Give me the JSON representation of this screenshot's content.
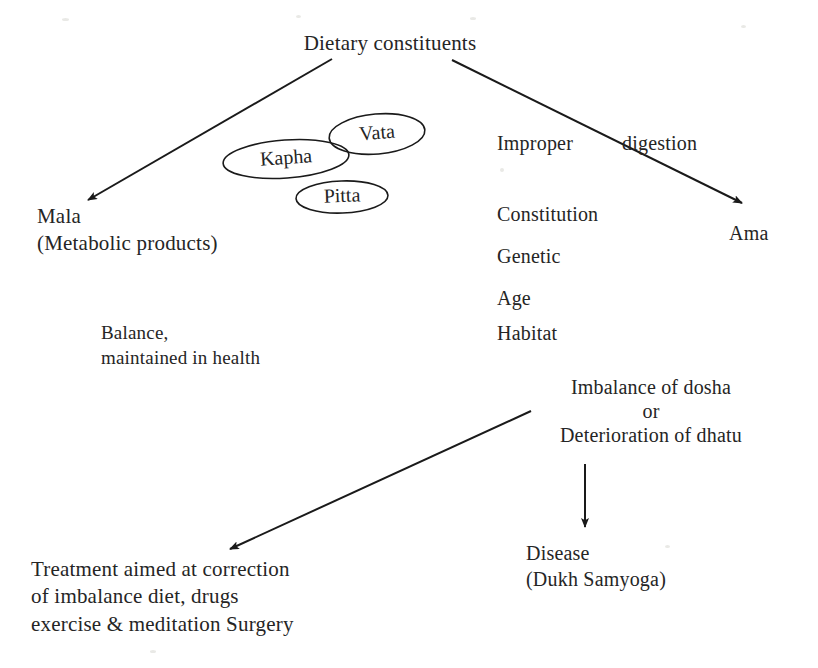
{
  "diagram": {
    "title_node": "Dietary constituents",
    "nodes": {
      "mala": "Mala\n(Metabolic products)",
      "improper_digestion_left": "Improper",
      "improper_digestion_right": "digestion",
      "ama": "Ama",
      "factors": [
        "Constitution",
        "Genetic",
        "Age",
        "Habitat"
      ],
      "balance": "Balance,\nmaintained in health",
      "imbalance_line1": "Imbalance of dosha",
      "imbalance_line2": "or",
      "imbalance_line3": "Deterioration of dhatu",
      "disease": "Disease\n(Dukh Samyoga)",
      "treatment": "Treatment aimed at correction\nof imbalance diet, drugs\nexercise & meditation Surgery"
    },
    "doshas": [
      {
        "label": "Vata",
        "cx": 377,
        "cy": 134,
        "rx": 48,
        "ry": 20,
        "rotate": -5
      },
      {
        "label": "Kapha",
        "cx": 286,
        "cy": 159,
        "rx": 63,
        "ry": 19,
        "rotate": -4
      },
      {
        "label": "Pitta",
        "cx": 342,
        "cy": 197,
        "rx": 46,
        "ry": 16,
        "rotate": -2
      }
    ],
    "arrows": [
      {
        "name": "to-mala",
        "x1": 332,
        "y1": 59,
        "x2": 88,
        "y2": 200
      },
      {
        "name": "to-ama",
        "x1": 452,
        "y1": 60,
        "x2": 742,
        "y2": 203
      },
      {
        "name": "to-treatment",
        "x1": 531,
        "y1": 411,
        "x2": 230,
        "y2": 549
      },
      {
        "name": "to-disease",
        "x1": 585,
        "y1": 464,
        "x2": 585,
        "y2": 527
      }
    ],
    "colors": {
      "ink": "#252525",
      "stroke": "#1a1a1a",
      "background": "#ffffff"
    }
  }
}
